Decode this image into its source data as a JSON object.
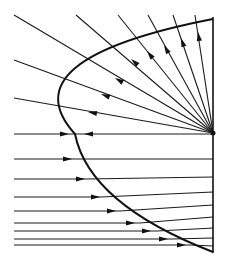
{
  "diagram": {
    "colors": {
      "line": "#111111",
      "background": "#ffffff"
    },
    "focus": {
      "x": 213,
      "y": 133
    },
    "axis_line": {
      "x": 213,
      "y1": 17,
      "y2": 253
    },
    "horizontal_axis": {
      "y": 134,
      "x1": 14,
      "x2": 213
    },
    "mirror_curve": {
      "top": [
        213,
        19
      ],
      "vertex": [
        75,
        134
      ],
      "bottom": [
        213,
        252
      ]
    },
    "upper_rays": [
      {
        "from": [
          14,
          15
        ],
        "hit": [
          113,
          80
        ],
        "arrow_at": [
          115,
          78
        ]
      },
      {
        "from": [
          76,
          15
        ],
        "hit": [
          128,
          60
        ],
        "arrow_at": [
          131,
          59
        ]
      },
      {
        "from": [
          118,
          15
        ],
        "hit": [
          143,
          47
        ],
        "arrow_at": [
          147,
          51
        ]
      },
      {
        "from": [
          148,
          15
        ],
        "hit": [
          162,
          38
        ],
        "arrow_at": [
          164,
          45
        ]
      },
      {
        "from": [
          173,
          15
        ],
        "hit": [
          179,
          30
        ],
        "arrow_at": [
          181,
          38
        ]
      },
      {
        "from": [
          195,
          15
        ],
        "hit": [
          198,
          24
        ],
        "arrow_at": [
          198,
          32
        ]
      },
      {
        "from": [
          14,
          60
        ],
        "hit": [
          92,
          91
        ],
        "arrow_at": [
          101,
          94
        ]
      },
      {
        "from": [
          14,
          98
        ],
        "hit": [
          80,
          110
        ],
        "arrow_at": [
          88,
          112
        ]
      }
    ],
    "lower_rays": [
      {
        "y": 159,
        "hit_x": 77,
        "end_y": 159,
        "arrow_x": 72
      },
      {
        "y": 179,
        "hit_x": 86,
        "end_y": 177,
        "arrow_x": 85
      },
      {
        "y": 197,
        "hit_x": 101,
        "end_y": 192,
        "arrow_x": 100
      },
      {
        "y": 211,
        "hit_x": 120,
        "end_y": 205,
        "arrow_x": 116
      },
      {
        "y": 223,
        "hit_x": 140,
        "end_y": 217,
        "arrow_x": 135
      },
      {
        "y": 231,
        "hit_x": 157,
        "end_y": 228,
        "arrow_x": 151
      },
      {
        "y": 239,
        "hit_x": 172,
        "end_y": 238,
        "arrow_x": 168
      },
      {
        "y": 245,
        "hit_x": 190,
        "end_y": 246,
        "arrow_x": 186
      }
    ],
    "axis_arrows": [
      {
        "x": 69,
        "direction": "right"
      },
      {
        "x": 84,
        "direction": "left"
      }
    ]
  }
}
